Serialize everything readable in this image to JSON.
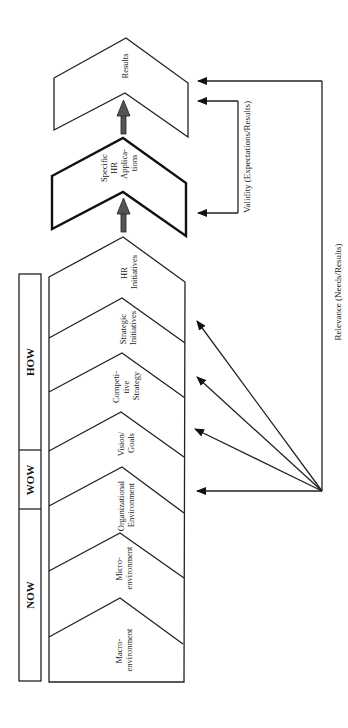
{
  "diagram": {
    "phases": [
      {
        "label": "HOW",
        "y_top": 274,
        "y_bottom": 450
      },
      {
        "label": "WOW",
        "y_top": 450,
        "y_bottom": 509
      },
      {
        "label": "NOW",
        "y_top": 509,
        "y_bottom": 681
      }
    ],
    "stages": [
      {
        "id": "hr-initiatives",
        "lines": [
          "HR",
          "Initiatives"
        ]
      },
      {
        "id": "strategic-initiatives",
        "lines": [
          "Strategic",
          "Initiatives"
        ]
      },
      {
        "id": "competitive-strategy",
        "lines": [
          "Competi-",
          "tive",
          "Strategy"
        ]
      },
      {
        "id": "vision-goals",
        "lines": [
          "Vision/",
          "Goals"
        ]
      },
      {
        "id": "organizational-environment",
        "lines": [
          "Organizational",
          "Environment"
        ]
      },
      {
        "id": "microenvironment",
        "lines": [
          "Micro-",
          "environment"
        ]
      },
      {
        "id": "macroenvironment",
        "lines": [
          "Macro-",
          "environment"
        ]
      }
    ],
    "specific_hr": {
      "lines": [
        "Specific",
        "HR",
        "Applica-",
        "tions"
      ]
    },
    "results": {
      "lines": [
        "Results"
      ]
    },
    "validity_label": "Validity (Expectations/Results)",
    "relevance_label": "Relevance (Needs/Results)",
    "colors": {
      "line": "#222222",
      "block_arrow": "#555555",
      "background": "#ffffff"
    }
  }
}
